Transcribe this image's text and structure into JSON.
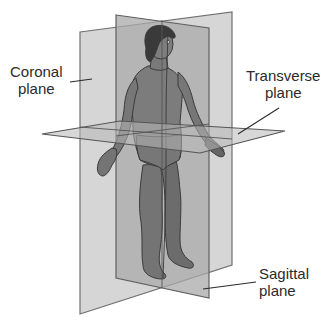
{
  "diagram": {
    "labels": {
      "coronal": {
        "line1": "Coronal",
        "line2": "plane"
      },
      "transverse": {
        "line1": "Transverse",
        "line2": "plane"
      },
      "sagittal": {
        "line1": "Sagittal",
        "line2": "plane"
      }
    },
    "colors": {
      "background": "#ffffff",
      "coronal_fill": "#d4d4d4",
      "sagittal_fill": "#b3b3b3",
      "transverse_fill": "#bdbdbd",
      "plane_edge": "#6e6e6e",
      "body_fill": "#7a7a7a",
      "body_outline": "#3a3a3a",
      "hair": "#3c3c3c",
      "text": "#2b2b2b",
      "leader_line": "#2b2b2b"
    }
  }
}
